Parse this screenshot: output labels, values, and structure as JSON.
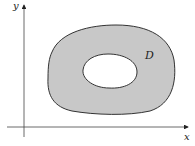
{
  "diagram": {
    "axes": {
      "x_label": "x",
      "y_label": "y"
    },
    "region": {
      "label": "D",
      "fill_color": "#c8c8c8",
      "stroke_color": "#333333",
      "hole_color": "#ffffff"
    }
  }
}
